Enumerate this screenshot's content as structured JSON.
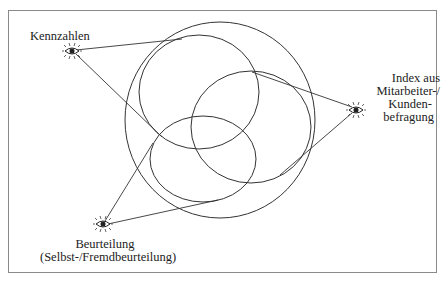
{
  "diagram": {
    "type": "venn-with-observers",
    "nodes": {
      "kennzahlen": {
        "label": "Kennzahlen",
        "icon": "eye-icon"
      },
      "index": {
        "label_lines": [
          "Index aus",
          "Mitarbeiter-/",
          "Kunden-",
          "befragung"
        ],
        "icon": "eye-icon"
      },
      "beurteilung": {
        "label_lines": [
          "Beurteilung",
          "(Selbst-/Fremdbeurteilung)"
        ],
        "icon": "eye-icon"
      }
    },
    "shapes": {
      "outer_circle": {
        "cx": 220,
        "cy": 120,
        "rx": 95,
        "ry": 98
      },
      "ellipse_top_left": {
        "cx": 199,
        "cy": 92,
        "rx": 60,
        "ry": 57
      },
      "ellipse_right": {
        "cx": 251,
        "cy": 127,
        "rx": 60,
        "ry": 56
      },
      "ellipse_bottom_left": {
        "cx": 203,
        "cy": 159,
        "rx": 53,
        "ry": 43
      }
    },
    "colors": {
      "stroke": "#333333",
      "frame": "#8a8a8a",
      "text": "#222222"
    }
  }
}
